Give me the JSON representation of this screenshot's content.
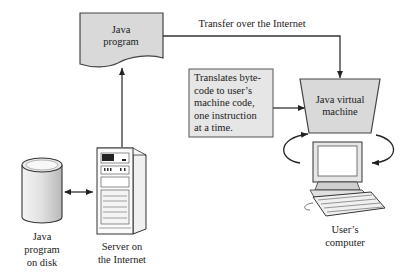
{
  "diagram": {
    "nodes": {
      "java_program": {
        "label": "Java\nprogram",
        "shape": "document",
        "fill": "#d9d9d9"
      },
      "jvm": {
        "label": "Java virtual\nmachine",
        "shape": "trapezoid",
        "fill": "#d9d9d9"
      },
      "translate_note": {
        "label": "Translates byte-\ncode to user’s\nmachine code,\none instruction\nat a time.",
        "shape": "rectangle",
        "fill": "#e6e6e6"
      },
      "disk": {
        "label": "Java\nprogram\non disk",
        "icon": "database-cylinder-icon"
      },
      "server": {
        "label": "Server on\nthe Internet",
        "icon": "server-tower-icon"
      },
      "user_computer": {
        "label": "User’s\ncomputer",
        "icon": "desktop-computer-icon"
      }
    },
    "edges": [
      {
        "from": "disk",
        "to": "server",
        "type": "bidirectional"
      },
      {
        "from": "server",
        "to": "java_program",
        "type": "arrow"
      },
      {
        "from": "java_program",
        "to": "jvm",
        "type": "arrow",
        "label": "Transfer over the Internet"
      },
      {
        "from": "translate_note",
        "to": "jvm",
        "type": "arrow"
      },
      {
        "from": "jvm",
        "to": "user_computer",
        "type": "cycle-arrows"
      }
    ],
    "colors": {
      "stroke": "#333333",
      "shape_fill": "#d9d9d9",
      "note_fill": "#e6e6e6",
      "background": "#ffffff"
    }
  }
}
